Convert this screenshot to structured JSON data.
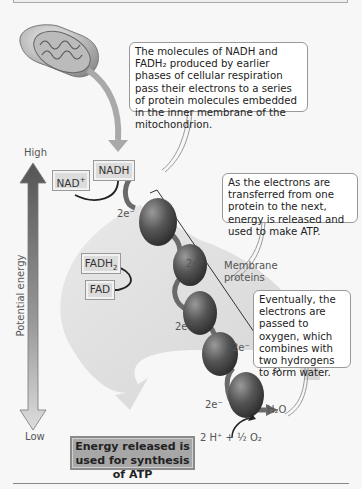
{
  "diagram": {
    "callouts": {
      "intro": "The molecules of NADH and FADH₂ produced by earlier phases of cellular respiration pass their electrons to a series of protein molecules embedded in the inner membrane of the mitochondrion.",
      "transfer": "As the electrons are transferred from one protein to the next, energy is released and used to make ATP.",
      "oxygen": "Eventually, the electrons are passed to oxygen, which combines with two hydrogens to form water."
    },
    "axis": {
      "high": "High",
      "low": "Low",
      "label": "Potential energy"
    },
    "molecules": {
      "nadh": "NADH",
      "nad_plus": "NAD",
      "nad_plus_sup": "+",
      "fadh2": "FADH",
      "fadh2_sub": "2",
      "fad": "FAD"
    },
    "electron_labels": [
      "2e⁻",
      "2e⁻",
      "2e⁻",
      "2e⁻",
      "2e⁻"
    ],
    "membrane_label": "Membrane proteins",
    "water": "H₂O",
    "reactants": "2 H⁺ + ½ O₂",
    "atp_box": "Energy released is used for synthesis of ATP",
    "colors": {
      "background": "#f7f7f7",
      "protein": "#4a4a4a",
      "arrow_dark": "#5a5a5a",
      "arrow_light": "#c8c8c8",
      "box_fill": "#dcdcdc",
      "atp_fill": "#a7a7a7"
    }
  }
}
